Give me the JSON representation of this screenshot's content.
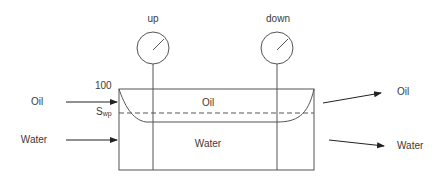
{
  "diagram": {
    "type": "coreflood-pressure-setup",
    "colors": {
      "line": "#555555",
      "arrow": "#222222",
      "text": "#3a3a3a",
      "background": "#ffffff"
    },
    "gauges": [
      {
        "id": "up",
        "label": "up"
      },
      {
        "id": "down",
        "label": "down"
      }
    ],
    "core": {
      "top_value_label": "100",
      "dashed_level_label_main": "S",
      "dashed_level_label_sub": "wp",
      "oil_zone_label": "Oil",
      "water_zone_label": "Water"
    },
    "inlets": [
      {
        "label": "Oil"
      },
      {
        "label": "Water"
      }
    ],
    "outlets": [
      {
        "label": "Oil"
      },
      {
        "label": "Water"
      }
    ]
  }
}
